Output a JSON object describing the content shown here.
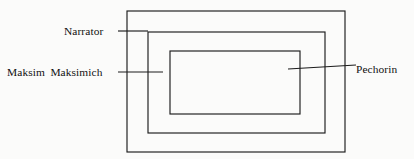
{
  "diagram": {
    "type": "nested-frame-diagram",
    "background_color": "#fbfbfa",
    "line_color": "#1c1c1c",
    "text_color": "#111111",
    "labels": {
      "outer": "Narrator",
      "middle": "Maksim Maksimich",
      "inner": "Pechorin"
    },
    "frames": [
      {
        "name": "outer-frame",
        "label": "Narrator",
        "level": 1,
        "x": 127,
        "y": 11,
        "width": 218,
        "height": 141
      },
      {
        "name": "middle-frame",
        "label": "Maksim Maksimich",
        "level": 2,
        "x": 148,
        "y": 32,
        "width": 177,
        "height": 101
      },
      {
        "name": "inner-frame",
        "label": "Pechorin",
        "level": 3,
        "x": 170,
        "y": 51,
        "width": 130,
        "height": 63
      }
    ],
    "leaders": [
      {
        "name": "narrator-leader",
        "x1": 118,
        "y1": 31,
        "x2": 148,
        "y2": 31
      },
      {
        "name": "maksim-leader",
        "x1": 118,
        "y1": 72,
        "x2": 163,
        "y2": 72
      },
      {
        "name": "pechorin-leader",
        "x1": 288,
        "y1": 69,
        "x2": 356,
        "y2": 65
      }
    ]
  }
}
